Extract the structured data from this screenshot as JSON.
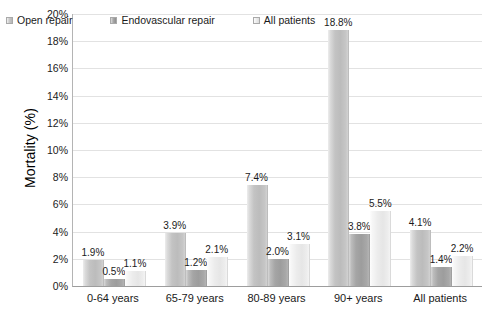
{
  "chart_data": {
    "type": "bar",
    "title": "",
    "xlabel": "",
    "ylabel": "Mortality (%)",
    "ylim": [
      0,
      20
    ],
    "grid": true,
    "legend_position": "top-left-inside",
    "categories": [
      "0-64 years",
      "65-79 years",
      "80-89 years",
      "90+ years",
      "All patients"
    ],
    "y_ticks": [
      "0%",
      "2%",
      "4%",
      "6%",
      "8%",
      "10%",
      "12%",
      "14%",
      "16%",
      "18%",
      "20%"
    ],
    "series": [
      {
        "name": "Open repair",
        "values": [
          1.9,
          3.9,
          7.4,
          18.8,
          4.1
        ],
        "labels": [
          "1.9%",
          "3.9%",
          "7.4%",
          "18.8%",
          "4.1%"
        ],
        "color": "#c3c3c3"
      },
      {
        "name": "Endovascular repair",
        "values": [
          0.5,
          1.2,
          2.0,
          3.8,
          1.4
        ],
        "labels": [
          "0.5%",
          "1.2%",
          "2.0%",
          "3.8%",
          "1.4%"
        ],
        "color": "#a5a5a5"
      },
      {
        "name": "All patients",
        "values": [
          1.1,
          2.1,
          3.1,
          5.5,
          2.2
        ],
        "labels": [
          "1.1%",
          "2.1%",
          "3.1%",
          "5.5%",
          "2.2%"
        ],
        "color": "#ececec"
      }
    ]
  }
}
